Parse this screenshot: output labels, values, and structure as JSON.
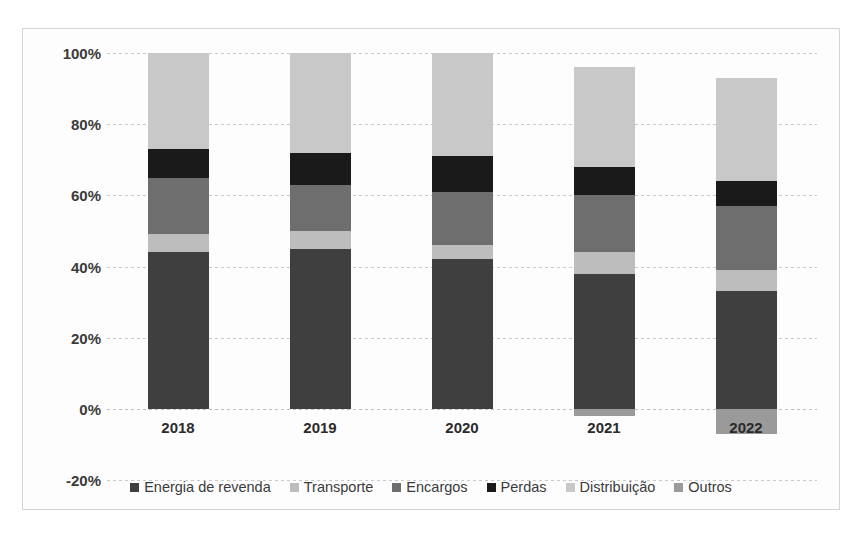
{
  "chart_data": {
    "type": "bar",
    "subtype": "stacked-bar-100",
    "title": "",
    "xlabel": "",
    "ylabel": "",
    "categories": [
      "2018",
      "2019",
      "2020",
      "2021",
      "2022"
    ],
    "ylim": [
      -20,
      100
    ],
    "yticks": [
      100,
      80,
      60,
      40,
      20,
      0,
      -20
    ],
    "ytick_labels": [
      "100%",
      "80%",
      "60%",
      "40%",
      "20%",
      "0%",
      "-20%"
    ],
    "grid": true,
    "legend_position": "bottom",
    "value_suffix": "%",
    "series": [
      {
        "name": "Energia de revenda",
        "color": "#3f3f3f",
        "values": [
          44,
          45,
          42,
          38,
          33
        ]
      },
      {
        "name": "Transporte",
        "color": "#bdbdbd",
        "values": [
          5,
          5,
          4,
          6,
          6
        ]
      },
      {
        "name": "Encargos",
        "color": "#6e6e6e",
        "values": [
          16,
          13,
          15,
          16,
          18
        ]
      },
      {
        "name": "Perdas",
        "color": "#1a1a1a",
        "values": [
          8,
          9,
          10,
          8,
          7
        ]
      },
      {
        "name": "Distribuição",
        "color": "#c8c8c8",
        "values": [
          27,
          28,
          29,
          28,
          29
        ]
      },
      {
        "name": "Outros",
        "color": "#9a9a9a",
        "values": [
          0,
          0,
          0,
          -2,
          -7
        ]
      }
    ]
  }
}
